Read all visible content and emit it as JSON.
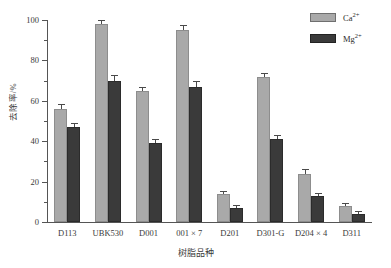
{
  "chart_data": {
    "type": "bar",
    "title": "",
    "xlabel": "树脂品种",
    "ylabel": "去除率/%",
    "categories": [
      "D113",
      "UBK530",
      "D001",
      "001 × 7",
      "D201",
      "D301-G",
      "D204 × 4",
      "D311"
    ],
    "series": [
      {
        "name": "Ca2+",
        "label_main": "Ca",
        "label_sup": "2+",
        "color": "#a9a9a9",
        "values": [
          56,
          98,
          65,
          95,
          14,
          72,
          24,
          8
        ],
        "errors": [
          2.5,
          2.0,
          2.0,
          2.5,
          1.5,
          2.0,
          2.0,
          1.5
        ]
      },
      {
        "name": "Mg2+",
        "label_main": "Mg",
        "label_sup": "2+",
        "color": "#3a3a3a",
        "values": [
          47,
          70,
          39,
          67,
          7,
          41,
          13,
          4
        ],
        "errors": [
          2.0,
          3.0,
          2.0,
          3.0,
          1.5,
          2.0,
          1.5,
          1.5
        ]
      }
    ],
    "ylim": [
      0,
      100
    ],
    "yticks": [
      0,
      20,
      40,
      60,
      80,
      100
    ],
    "yminor_step": 10,
    "grid": false,
    "legend_position": "top-right"
  }
}
